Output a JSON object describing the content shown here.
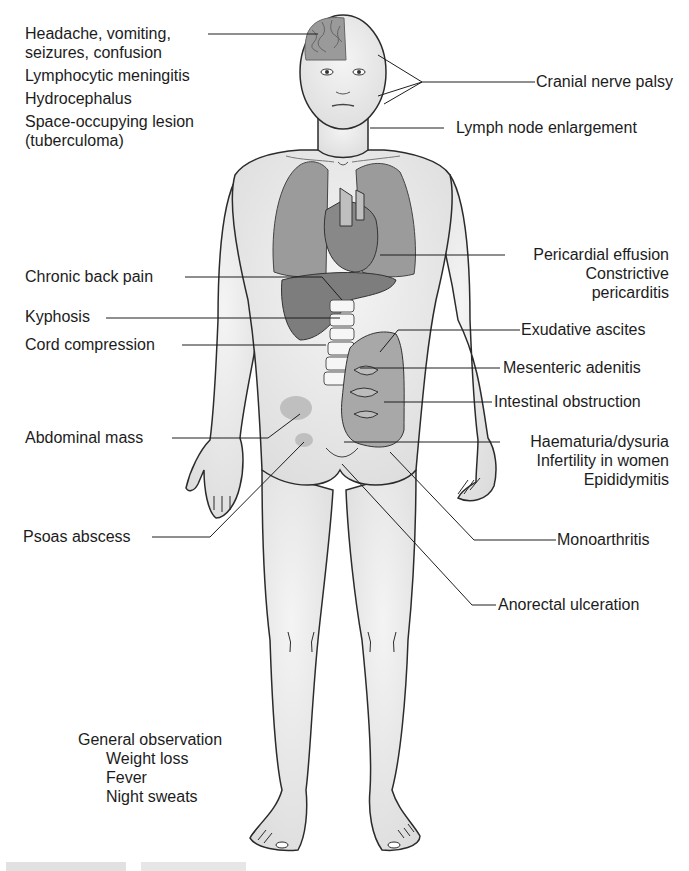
{
  "figure": {
    "left_labels": [
      {
        "id": "headache",
        "lines": [
          "Headache, vomiting,",
          "seizures, confusion"
        ]
      },
      {
        "id": "meningitis",
        "lines": [
          "Lymphocytic meningitis"
        ]
      },
      {
        "id": "hydrocephalus",
        "lines": [
          "Hydrocephalus"
        ]
      },
      {
        "id": "space-occupying",
        "lines": [
          "Space-occupying lesion",
          "(tuberculoma)"
        ]
      },
      {
        "id": "back-pain",
        "lines": [
          "Chronic back pain"
        ]
      },
      {
        "id": "kyphosis",
        "lines": [
          "Kyphosis"
        ]
      },
      {
        "id": "cord-compression",
        "lines": [
          "Cord compression"
        ]
      },
      {
        "id": "abdominal-mass",
        "lines": [
          "Abdominal mass"
        ]
      },
      {
        "id": "psoas-abscess",
        "lines": [
          "Psoas abscess"
        ]
      }
    ],
    "right_labels": [
      {
        "id": "cranial-nerve",
        "lines": [
          "Cranial nerve palsy"
        ]
      },
      {
        "id": "lymph-node",
        "lines": [
          "Lymph node enlargement"
        ]
      },
      {
        "id": "pericardial",
        "lines": [
          "Pericardial effusion",
          "Constrictive",
          "pericarditis"
        ]
      },
      {
        "id": "ascites",
        "lines": [
          "Exudative ascites"
        ]
      },
      {
        "id": "mesenteric",
        "lines": [
          "Mesenteric adenitis"
        ]
      },
      {
        "id": "intestinal",
        "lines": [
          "Intestinal obstruction"
        ]
      },
      {
        "id": "haematuria",
        "lines": [
          "Haematuria/dysuria",
          "Infertility in women",
          "Epididymitis"
        ]
      },
      {
        "id": "monoarthritis",
        "lines": [
          "Monoarthritis"
        ]
      },
      {
        "id": "anorectal",
        "lines": [
          "Anorectal ulceration"
        ]
      }
    ],
    "general": {
      "title": "General observation",
      "items": [
        "Weight loss",
        "Fever",
        "Night sweats"
      ]
    },
    "colors": {
      "skin": "#e9e9e9",
      "outline": "#2b2b2b",
      "organ": "#8e8e8e",
      "organ_dark": "#777777",
      "line": "#1e1e1e"
    }
  }
}
